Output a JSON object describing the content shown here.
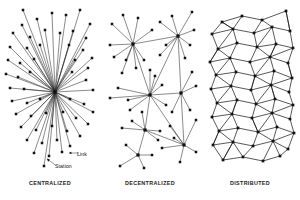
{
  "figure": {
    "title_visible": false,
    "background_color": "#ffffff",
    "node_color": "#111111",
    "edge_color": "#2b2b2b"
  },
  "panels": [
    {
      "id": "centralized",
      "caption": "CENTRALIZED",
      "topology": "star",
      "hubs": [
        [
          55,
          92
        ]
      ],
      "callouts": [
        {
          "id": "link",
          "label": "Link",
          "marker": "arrow-left"
        },
        {
          "id": "station",
          "label": "Station",
          "marker": "arrow-up-left"
        }
      ],
      "nodes": [
        [
          23,
          10
        ],
        [
          37,
          19
        ],
        [
          52,
          13
        ],
        [
          66,
          15
        ],
        [
          80,
          10
        ],
        [
          90,
          24
        ],
        [
          22,
          25
        ],
        [
          13,
          33
        ],
        [
          30,
          37
        ],
        [
          45,
          30
        ],
        [
          60,
          33
        ],
        [
          73,
          31
        ],
        [
          86,
          38
        ],
        [
          10,
          47
        ],
        [
          27,
          48
        ],
        [
          40,
          45
        ],
        [
          69,
          45
        ],
        [
          83,
          50
        ],
        [
          92,
          58
        ],
        [
          8,
          60
        ],
        [
          20,
          63
        ],
        [
          34,
          59
        ],
        [
          75,
          60
        ],
        [
          88,
          68
        ],
        [
          6,
          74
        ],
        [
          18,
          77
        ],
        [
          30,
          72
        ],
        [
          72,
          72
        ],
        [
          86,
          80
        ],
        [
          10,
          88
        ],
        [
          24,
          89
        ],
        [
          93,
          90
        ],
        [
          12,
          101
        ],
        [
          27,
          103
        ],
        [
          40,
          99
        ],
        [
          70,
          99
        ],
        [
          84,
          104
        ],
        [
          93,
          112
        ],
        [
          16,
          114
        ],
        [
          31,
          116
        ],
        [
          46,
          113
        ],
        [
          63,
          112
        ],
        [
          76,
          118
        ],
        [
          88,
          124
        ],
        [
          21,
          127
        ],
        [
          36,
          130
        ],
        [
          52,
          126
        ],
        [
          67,
          131
        ],
        [
          80,
          136
        ],
        [
          27,
          140
        ],
        [
          42,
          143
        ],
        [
          57,
          140
        ],
        [
          70,
          146
        ],
        [
          34,
          153
        ],
        [
          49,
          156
        ],
        [
          62,
          152
        ],
        [
          44,
          166
        ]
      ],
      "edges_from_hub_to_all": true
    },
    {
      "id": "decentralized",
      "caption": "DECENTRALIZED",
      "topology": "multi-hub",
      "hubs": [
        [
          33,
          44
        ],
        [
          78,
          36
        ],
        [
          50,
          95
        ],
        [
          81,
          93
        ],
        [
          45,
          130
        ],
        [
          38,
          155
        ],
        [
          84,
          145
        ]
      ],
      "nodes": [
        [
          12,
          24
        ],
        [
          23,
          15
        ],
        [
          38,
          18
        ],
        [
          52,
          30
        ],
        [
          10,
          45
        ],
        [
          14,
          57
        ],
        [
          26,
          60
        ],
        [
          44,
          60
        ],
        [
          50,
          70
        ],
        [
          60,
          22
        ],
        [
          72,
          16
        ],
        [
          92,
          12
        ],
        [
          94,
          30
        ],
        [
          90,
          45
        ],
        [
          66,
          45
        ],
        [
          60,
          55
        ],
        [
          85,
          58
        ],
        [
          22,
          73
        ],
        [
          36,
          68
        ],
        [
          18,
          88
        ],
        [
          10,
          98
        ],
        [
          28,
          100
        ],
        [
          30,
          110
        ],
        [
          42,
          112
        ],
        [
          55,
          76
        ],
        [
          62,
          85
        ],
        [
          66,
          105
        ],
        [
          72,
          112
        ],
        [
          92,
          72
        ],
        [
          96,
          86
        ],
        [
          90,
          110
        ],
        [
          70,
          126
        ],
        [
          60,
          131
        ],
        [
          32,
          121
        ],
        [
          22,
          128
        ],
        [
          58,
          140
        ],
        [
          26,
          145
        ],
        [
          52,
          155
        ],
        [
          20,
          166
        ],
        [
          44,
          168
        ],
        [
          96,
          120
        ],
        [
          74,
          138
        ],
        [
          96,
          152
        ],
        [
          80,
          162
        ],
        [
          62,
          148
        ]
      ]
    },
    {
      "id": "distributed",
      "caption": "DISTRIBUTED",
      "topology": "mesh-lattice",
      "node_count": 54
    }
  ]
}
